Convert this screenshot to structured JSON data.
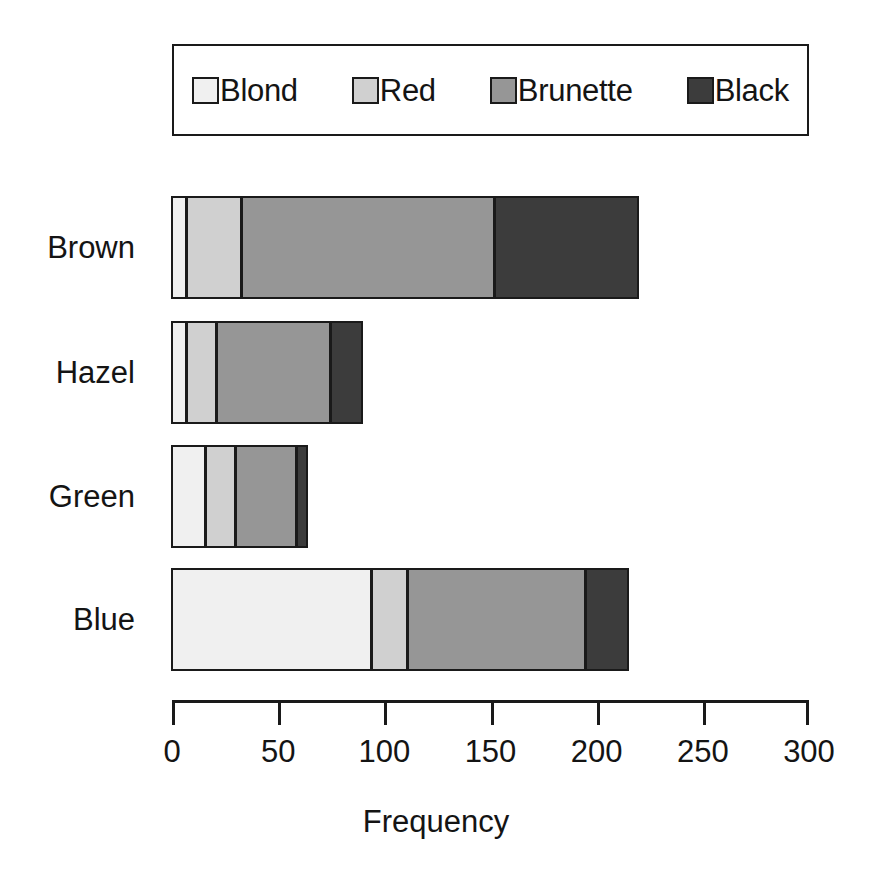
{
  "chart_data": {
    "type": "bar",
    "orientation": "horizontal",
    "stacked": true,
    "title": "",
    "subtitle": "",
    "xlabel": "Frequency",
    "ylabel": "",
    "categories": [
      "Brown",
      "Hazel",
      "Green",
      "Blue"
    ],
    "series": [
      {
        "name": "Blond",
        "color": "#f0f0f0",
        "values": [
          7,
          7,
          16,
          94
        ]
      },
      {
        "name": "Red",
        "color": "#d0d0d0",
        "values": [
          26,
          14,
          14,
          17
        ]
      },
      {
        "name": "Brunette",
        "color": "#969696",
        "values": [
          119,
          54,
          29,
          84
        ]
      },
      {
        "name": "Black",
        "color": "#3c3c3c",
        "values": [
          68,
          15,
          5,
          20
        ]
      }
    ],
    "totals": [
      220,
      90,
      64,
      215
    ],
    "xlim": [
      0,
      300
    ],
    "xticks": [
      0,
      50,
      100,
      150,
      200,
      250,
      300
    ],
    "xtick_labels": [
      "0",
      "50",
      "100",
      "150",
      "200",
      "250",
      "300"
    ],
    "grid": false,
    "legend_position": "top",
    "legend_border": true,
    "axis_color": "#1a1a1a",
    "background": "#ffffff"
  },
  "legend": {
    "entries": [
      {
        "label": "Blond",
        "color": "#f0f0f0"
      },
      {
        "label": "Red",
        "color": "#d0d0d0"
      },
      {
        "label": "Brunette",
        "color": "#969696"
      },
      {
        "label": "Black",
        "color": "#3c3c3c"
      }
    ]
  },
  "axis": {
    "title": "Frequency",
    "ticks": [
      "0",
      "50",
      "100",
      "150",
      "200",
      "250",
      "300"
    ]
  },
  "categories": [
    {
      "label": "Brown"
    },
    {
      "label": "Hazel"
    },
    {
      "label": "Green"
    },
    {
      "label": "Blue"
    }
  ]
}
